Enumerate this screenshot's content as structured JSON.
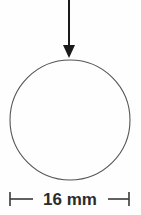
{
  "diagram": {
    "background_color": "#fefefe",
    "stroke_color": "#555555",
    "arrow_color": "#1a1a1a",
    "dimension_color": "#3a3a3a",
    "text_color": "#2b2b2b",
    "load_arrow": {
      "name": "downward load arrow",
      "direction": "down",
      "shaft_x": 69,
      "shaft_top_y": 0,
      "shaft_bottom_y": 45,
      "tip_y": 58,
      "head_half_width": 6,
      "head_height": 13,
      "shaft_width": 2
    },
    "circle": {
      "name": "circle outline",
      "center_x": 70,
      "center_y": 120,
      "radius": 60,
      "fill": "none",
      "stroke_width": 1.1
    },
    "dimension": {
      "name": "diameter dimension",
      "label": "16 mm",
      "value": 16,
      "unit": "mm",
      "line_y": 199,
      "left_x": 10,
      "right_x": 129,
      "tick_half_height": 7,
      "label_center_x": 70,
      "label_baseline_y": 205,
      "gap_left_x": 33,
      "gap_right_x": 108,
      "line_width": 1.6
    }
  }
}
